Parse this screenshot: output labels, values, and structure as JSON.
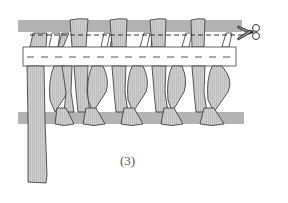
{
  "figure": {
    "label": "(3)",
    "colors": {
      "bar": "#b3b3b3",
      "strip": "#cccccc",
      "outline": "#333333",
      "tape": "#ffffff",
      "dash": "#555555"
    },
    "icons": {
      "scissors": "scissors-icon"
    }
  }
}
